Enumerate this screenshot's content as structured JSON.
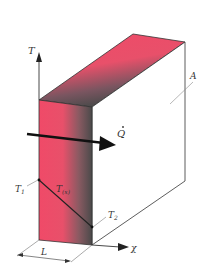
{
  "figure": {
    "labels": {
      "temperature_axis": "T",
      "heat_flow": "Q",
      "area": "A",
      "t1": "T",
      "t1_sub": "1",
      "t2": "T",
      "t2_sub": "2",
      "tx": "T",
      "tx_sub": "(x)",
      "x_axis": "χ",
      "thickness": "L"
    },
    "colors": {
      "hot": "#f04a68",
      "cold": "#4a4a4a",
      "line": "#333333",
      "arrow": "#111111"
    }
  }
}
